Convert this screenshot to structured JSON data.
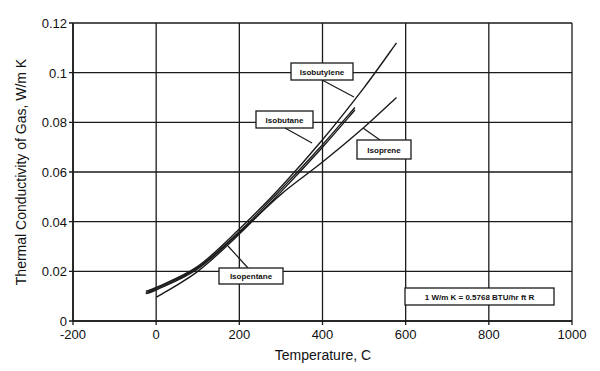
{
  "chart_data": {
    "type": "line",
    "title": "",
    "xlabel": "Temperature, C",
    "ylabel": "Thermal Conductivity of Gas, W/m K",
    "xlim": [
      -200,
      1000
    ],
    "ylim": [
      0,
      0.12
    ],
    "x_ticks": [
      "-200",
      "0",
      "200",
      "400",
      "600",
      "800",
      "1000"
    ],
    "y_ticks": [
      "0",
      "0.02",
      "0.04",
      "0.06",
      "0.08",
      "0.1",
      "0.12"
    ],
    "grid": true,
    "legend": "inline callout labels",
    "series": [
      {
        "name": "Isobutylene",
        "x": [
          -25,
          0,
          100,
          200,
          300,
          400,
          500,
          578
        ],
        "y": [
          0.012,
          0.0135,
          0.022,
          0.037,
          0.054,
          0.073,
          0.094,
          0.112
        ]
      },
      {
        "name": "Isobutane",
        "x": [
          -25,
          0,
          100,
          200,
          300,
          400,
          478
        ],
        "y": [
          0.0115,
          0.013,
          0.0215,
          0.036,
          0.053,
          0.071,
          0.086
        ]
      },
      {
        "name": "Isoprene",
        "x": [
          -25,
          0,
          100,
          200,
          300,
          400,
          500,
          578
        ],
        "y": [
          0.011,
          0.0125,
          0.021,
          0.0355,
          0.051,
          0.064,
          0.078,
          0.09
        ]
      },
      {
        "name": "Isopentane",
        "x": [
          0,
          100,
          200,
          300,
          400,
          478
        ],
        "y": [
          0.0095,
          0.02,
          0.035,
          0.052,
          0.07,
          0.085
        ]
      }
    ],
    "annotations": [
      "Isobutylene",
      "Isobutane",
      "Isoprene",
      "Isopentane",
      "1 W/m K = 0.5768 BTU/hr ft R"
    ]
  },
  "labels": {
    "isobutylene": "Isobutylene",
    "isobutane": "Isobutane",
    "isoprene": "Isoprene",
    "isopentane": "Isopentane",
    "conversion": "1 W/m K = 0.5768 BTU/hr ft R"
  }
}
